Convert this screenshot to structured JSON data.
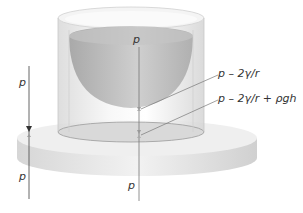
{
  "diagram": {
    "labels": {
      "left_top": "p",
      "left_bottom": "p",
      "center_top": "p",
      "center_bottom": "p",
      "meniscus_pressure": "p – 2γ/r",
      "base_pressure": "p – 2γ/r + ρgh"
    },
    "colors": {
      "cylinder": "#e8e8e8",
      "meniscus": "#b5b5b5",
      "disc_top": "#ececec",
      "disc_side": "#dcdcdc",
      "arrow": "#555555",
      "text": "#333333"
    }
  }
}
